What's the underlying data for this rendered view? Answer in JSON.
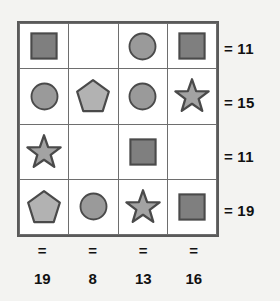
{
  "puzzle": {
    "type": "shape-sum-grid",
    "rows": 4,
    "columns": 4,
    "grid": [
      [
        {
          "shape": "square",
          "icon": "square-icon"
        },
        {
          "shape": "empty",
          "icon": "empty-cell"
        },
        {
          "shape": "circle",
          "icon": "circle-icon"
        },
        {
          "shape": "square",
          "icon": "square-icon"
        }
      ],
      [
        {
          "shape": "circle",
          "icon": "circle-icon"
        },
        {
          "shape": "pentagon",
          "icon": "pentagon-icon"
        },
        {
          "shape": "circle",
          "icon": "circle-icon"
        },
        {
          "shape": "star",
          "icon": "star-icon"
        }
      ],
      [
        {
          "shape": "star",
          "icon": "star-icon"
        },
        {
          "shape": "empty",
          "icon": "empty-cell"
        },
        {
          "shape": "square",
          "icon": "square-icon"
        },
        {
          "shape": "empty",
          "icon": "empty-cell"
        }
      ],
      [
        {
          "shape": "pentagon",
          "icon": "pentagon-icon"
        },
        {
          "shape": "circle",
          "icon": "circle-icon"
        },
        {
          "shape": "star",
          "icon": "star-icon"
        },
        {
          "shape": "square",
          "icon": "square-icon"
        }
      ]
    ],
    "row_sums": [
      {
        "equals": "=",
        "value": "11"
      },
      {
        "equals": "=",
        "value": "15"
      },
      {
        "equals": "=",
        "value": "11"
      },
      {
        "equals": "=",
        "value": "19"
      }
    ],
    "column_sums": [
      {
        "equals": "=",
        "value": "19"
      },
      {
        "equals": "=",
        "value": "8"
      },
      {
        "equals": "=",
        "value": "13"
      },
      {
        "equals": "=",
        "value": "16"
      }
    ]
  },
  "colors": {
    "background": "#f3f3f1",
    "cell_background": "#ffffff",
    "grid_outer_border": "#5a5a5a",
    "grid_inner_border": "#6e6e6e",
    "square_fill": "#7f7f7f",
    "circle_fill": "#9a9a9a",
    "pentagon_fill": "#b2b2b2",
    "star_fill": "#a3a3a3",
    "shape_stroke": "#4a4a4a",
    "text": "#111111"
  }
}
